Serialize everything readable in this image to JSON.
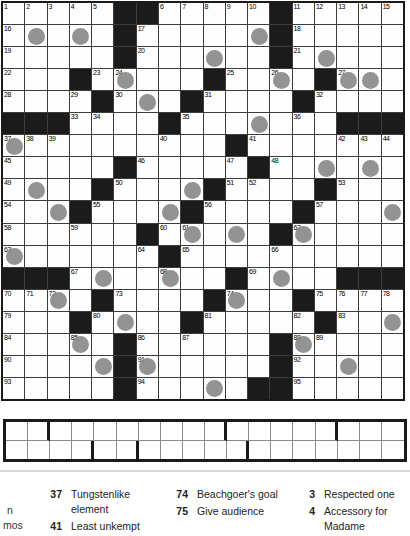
{
  "puzzle": {
    "rows": 18,
    "cols": 18,
    "grid": [
      ".....##.....#.....",
      ".O.O.#.....O#.....",
      ".....#...O..#.O...",
      "...#.O...#..O.#OO.",
      "....#.O.#....#....",
      "###....#...O...###",
      "O.........#.......",
      ".....#.....#..O.O.",
      ".O..#...O#....#...",
      "..O#...O#....#...O",
      "......#.O.O.#O....",
      "O......#..........",
      "###.O..O..#.O..###",
      "..O.#....#O..#....",
      "...#.O..#.....#..O",
      "...O.#......#O....",
      "....O#O.....#..O..",
      ".....#...O.##....."
    ],
    "numbers": {
      "0-0": "1",
      "0-1": "2",
      "0-2": "3",
      "0-3": "4",
      "0-4": "5",
      "0-7": "6",
      "0-8": "7",
      "0-9": "8",
      "0-10": "9",
      "0-11": "10",
      "0-13": "11",
      "0-14": "12",
      "0-15": "13",
      "0-16": "14",
      "0-17": "15",
      "1-0": "16",
      "1-6": "17",
      "1-13": "18",
      "2-0": "19",
      "2-6": "20",
      "2-13": "21",
      "3-0": "22",
      "3-4": "23",
      "3-5": "24",
      "3-10": "25",
      "3-12": "26",
      "3-15": "27",
      "4-0": "28",
      "4-3": "29",
      "4-5": "30",
      "4-9": "31",
      "4-14": "32",
      "5-3": "33",
      "5-4": "34",
      "5-8": "35",
      "5-13": "36",
      "6-0": "37",
      "6-1": "38",
      "6-2": "39",
      "6-7": "40",
      "6-11": "41",
      "6-15": "42",
      "6-16": "43",
      "6-17": "44",
      "7-0": "45",
      "7-6": "46",
      "7-10": "47",
      "7-12": "48",
      "8-0": "49",
      "8-5": "50",
      "8-10": "51",
      "8-11": "52",
      "8-15": "53",
      "9-0": "54",
      "9-4": "55",
      "9-9": "56",
      "9-14": "57",
      "10-0": "58",
      "10-3": "59",
      "10-7": "60",
      "10-8": "61",
      "10-13": "62",
      "11-0": "63",
      "11-6": "64",
      "11-8": "65",
      "11-12": "66",
      "12-3": "67",
      "12-7": "68",
      "12-11": "69",
      "13-0": "70",
      "13-1": "71",
      "13-2": "72",
      "13-5": "73",
      "13-10": "74",
      "13-14": "75",
      "13-15": "76",
      "13-16": "77",
      "13-17": "78",
      "14-0": "79",
      "14-4": "80",
      "14-9": "81",
      "14-13": "82",
      "14-15": "83",
      "15-0": "84",
      "15-3": "85",
      "15-6": "86",
      "15-8": "87",
      "15-13": "88",
      "15-14": "89",
      "16-0": "90",
      "16-6": "91",
      "16-13": "92",
      "17-0": "93",
      "17-6": "94",
      "17-13": "95"
    },
    "colors": {
      "black_cell": "#1b1b1b",
      "grid_line": "#3c3c3c",
      "circle": "#8b8b8b",
      "white_cell": "#fdfdfd"
    }
  },
  "answer_strip": {
    "rows": 2,
    "cols": 18,
    "word_lengths": [
      [
        2,
        8,
        5,
        3
      ],
      [
        4,
        2,
        5,
        7
      ]
    ]
  },
  "clues": {
    "left_fragments": [
      {
        "text": "n",
        "x": 7,
        "y": 17
      },
      {
        "text": "mos",
        "x": 3,
        "y": 32
      }
    ],
    "columns": [
      {
        "items": [
          {
            "num": "37",
            "text": "Tungstenlike element"
          },
          {
            "num": "41",
            "text": "Least unkempt"
          }
        ]
      },
      {
        "items": [
          {
            "num": "74",
            "text": "Beachgoer's goal"
          },
          {
            "num": "75",
            "text": "Give audience"
          }
        ]
      },
      {
        "items": [
          {
            "num": "3",
            "text": "Respected one"
          },
          {
            "num": "4",
            "text": "Accessory for Madame"
          }
        ]
      }
    ]
  }
}
